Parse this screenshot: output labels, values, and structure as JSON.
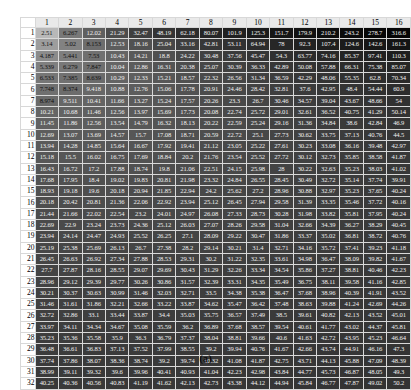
{
  "figure": {
    "caption": "(a)",
    "corner_label": ""
  },
  "colors": {
    "low": "#b4b4b4",
    "high": "#050505",
    "header_bg": "#e9e9e9",
    "header_text": "#000000",
    "page_bg": "#ffffff",
    "grid_line": "#d8d8d8",
    "text_on_light": "#111111",
    "text_on_dark": "#efefef"
  },
  "chart_data": {
    "type": "heatmap",
    "title": "",
    "subtitle": "",
    "xlabel": "",
    "ylabel": "",
    "grid": true,
    "legend": "none",
    "colorscale": {
      "name": "grayscale-reversed",
      "low_color": "#b4b4b4",
      "high_color": "#050505",
      "vmin": 2.51,
      "vmax": 310.0,
      "note": "cell background darkens as value increases"
    },
    "column_headers": [
      1,
      2,
      3,
      4,
      5,
      6,
      7,
      8,
      9,
      10,
      11,
      12,
      13,
      14,
      15,
      16
    ],
    "row_headers": [
      1,
      2,
      3,
      4,
      5,
      6,
      7,
      8,
      9,
      10,
      11,
      12,
      13,
      14,
      15,
      16,
      17,
      18,
      19,
      20,
      21,
      22,
      23,
      24,
      25,
      26,
      27,
      28,
      29,
      30,
      31,
      32
    ],
    "values": [
      [
        2.51,
        6.267,
        12.02,
        21.29,
        32.47,
        48.19,
        62.18,
        80.07,
        101.9,
        125.3,
        151.7,
        179.9,
        210.2,
        243.2,
        278.7,
        316.6
      ],
      [
        3.14,
        5.02,
        8.153,
        12.53,
        18.16,
        25.04,
        33.16,
        42.81,
        53.11,
        64.94,
        78.0,
        92.3,
        107.4,
        124.6,
        142.6,
        161.3
      ],
      [
        4.187,
        5.441,
        7.53,
        10.43,
        14.21,
        18.8,
        24.22,
        30.48,
        37.56,
        45.47,
        54.3,
        63.77,
        74.16,
        85.37,
        97.41,
        110.3
      ],
      [
        5.339,
        6.279,
        7.847,
        10.04,
        12.86,
        16.31,
        20.38,
        25.07,
        30.39,
        36.33,
        42.89,
        50.08,
        57.88,
        66.31,
        75.38,
        85.07
      ],
      [
        6.533,
        7.385,
        8.639,
        10.29,
        12.33,
        15.21,
        18.57,
        22.32,
        26.56,
        31.34,
        36.59,
        42.29,
        48.06,
        55.35,
        62.8,
        70.34
      ],
      [
        7.748,
        8.374,
        9.418,
        10.88,
        12.76,
        15.06,
        17.78,
        20.91,
        24.46,
        28.42,
        32.81,
        37.6,
        42.95,
        48.4,
        54.44,
        60.9
      ],
      [
        8.974,
        9.511,
        10.41,
        11.66,
        13.27,
        15.24,
        17.57,
        20.26,
        23.3,
        26.7,
        30.46,
        34.57,
        39.04,
        43.67,
        48.66,
        54.0
      ],
      [
        10.21,
        10.68,
        11.46,
        12.56,
        13.97,
        15.69,
        17.73,
        20.08,
        22.74,
        25.72,
        29.01,
        32.61,
        36.52,
        40.75,
        41.29,
        50.14
      ],
      [
        11.45,
        11.86,
        12.56,
        13.54,
        14.79,
        16.32,
        18.13,
        20.22,
        22.59,
        25.24,
        29.16,
        31.36,
        34.84,
        38.6,
        42.84,
        46.9
      ],
      [
        12.69,
        13.07,
        13.69,
        14.57,
        15.7,
        17.08,
        18.71,
        20.59,
        22.72,
        25.1,
        27.73,
        30.62,
        33.75,
        37.13,
        40.76,
        44.5
      ],
      [
        13.94,
        14.28,
        14.85,
        15.64,
        16.67,
        17.92,
        19.41,
        21.12,
        23.05,
        25.22,
        27.61,
        30.23,
        33.08,
        36.16,
        39.48,
        42.97
      ],
      [
        15.18,
        15.5,
        16.02,
        16.75,
        17.69,
        18.84,
        20.2,
        21.76,
        23.54,
        25.52,
        27.72,
        30.12,
        32.73,
        35.85,
        38.58,
        41.87
      ],
      [
        16.43,
        16.72,
        17.2,
        17.88,
        18.74,
        19.8,
        21.06,
        22.51,
        24.15,
        25.98,
        28.0,
        30.22,
        32.63,
        35.23,
        38.03,
        41.02
      ],
      [
        17.68,
        17.95,
        18.4,
        19.02,
        19.83,
        20.81,
        21.98,
        23.32,
        24.84,
        26.55,
        28.45,
        30.49,
        32.72,
        35.14,
        37.74,
        39.91
      ],
      [
        18.93,
        19.18,
        19.6,
        20.18,
        20.94,
        21.85,
        22.94,
        24.2,
        25.62,
        27.2,
        28.96,
        30.88,
        32.97,
        35.23,
        37.65,
        40.24
      ],
      [
        20.18,
        20.42,
        20.81,
        21.36,
        22.06,
        22.92,
        23.94,
        25.12,
        26.45,
        27.94,
        29.58,
        31.39,
        33.35,
        35.46,
        37.72,
        40.16
      ],
      [
        21.44,
        21.66,
        22.02,
        22.54,
        23.2,
        24.01,
        24.97,
        26.08,
        27.33,
        28.73,
        30.28,
        31.98,
        33.82,
        35.81,
        37.95,
        40.24
      ],
      [
        22.69,
        22.9,
        23.24,
        23.73,
        24.36,
        25.12,
        26.03,
        27.07,
        28.26,
        29.58,
        31.04,
        32.66,
        34.39,
        36.27,
        38.29,
        40.45
      ],
      [
        23.94,
        24.14,
        24.47,
        24.93,
        25.52,
        26.25,
        27.1,
        28.09,
        29.22,
        30.47,
        31.86,
        33.37,
        35.02,
        36.81,
        38.72,
        40.76
      ],
      [
        25.19,
        25.38,
        25.69,
        26.13,
        26.7,
        27.38,
        28.2,
        29.14,
        30.21,
        31.4,
        32.71,
        34.16,
        35.72,
        37.41,
        39.23,
        41.18
      ],
      [
        26.45,
        26.63,
        26.92,
        27.34,
        27.88,
        28.53,
        29.31,
        30.2,
        31.22,
        32.35,
        33.61,
        34.98,
        36.47,
        38.09,
        39.82,
        41.67
      ],
      [
        27.7,
        27.87,
        28.16,
        28.55,
        29.07,
        29.69,
        30.43,
        31.29,
        32.26,
        33.34,
        34.54,
        35.86,
        37.27,
        38.81,
        40.46,
        42.23
      ],
      [
        28.96,
        29.12,
        29.39,
        29.77,
        30.26,
        30.86,
        31.57,
        32.39,
        33.31,
        34.35,
        35.49,
        36.75,
        38.11,
        39.58,
        41.16,
        42.85
      ],
      [
        30.21,
        30.37,
        30.63,
        30.99,
        31.46,
        32.03,
        32.71,
        33.5,
        34.38,
        35.38,
        36.47,
        37.68,
        38.96,
        40.39,
        41.91,
        43.52
      ],
      [
        31.46,
        31.61,
        31.86,
        32.21,
        32.66,
        33.22,
        33.87,
        34.62,
        35.47,
        36.42,
        37.48,
        38.63,
        39.88,
        41.24,
        42.69,
        44.26
      ],
      [
        32.72,
        32.86,
        33.1,
        33.44,
        33.87,
        34.4,
        35.03,
        35.75,
        36.57,
        37.49,
        38.5,
        39.61,
        40.82,
        42.13,
        43.52,
        45.01
      ],
      [
        33.97,
        34.11,
        34.34,
        34.67,
        35.08,
        35.59,
        36.2,
        36.89,
        37.68,
        38.57,
        39.54,
        40.61,
        41.77,
        43.02,
        44.37,
        45.81
      ],
      [
        35.23,
        35.36,
        35.58,
        35.9,
        36.3,
        36.79,
        37.37,
        38.04,
        38.81,
        39.66,
        40.6,
        41.63,
        42.72,
        43.95,
        45.23,
        46.64
      ],
      [
        36.48,
        36.61,
        36.83,
        37.13,
        37.52,
        37.99,
        38.55,
        39.2,
        39.94,
        40.76,
        41.67,
        42.66,
        43.74,
        44.91,
        46.16,
        47.3
      ],
      [
        37.74,
        37.86,
        38.07,
        38.36,
        38.74,
        39.2,
        39.74,
        40.32,
        41.08,
        41.87,
        42.75,
        43.71,
        44.13,
        45.88,
        47.09,
        48.39
      ],
      [
        38.99,
        39.11,
        39.32,
        39.6,
        39.96,
        40.41,
        40.93,
        41.04,
        42.23,
        42.98,
        43.84,
        44.77,
        45.73,
        46.87,
        48.05,
        49.3
      ],
      [
        40.25,
        40.36,
        40.56,
        40.83,
        41.19,
        41.62,
        42.13,
        42.73,
        43.38,
        44.12,
        44.94,
        45.84,
        46.77,
        47.87,
        49.02,
        50.2
      ]
    ]
  }
}
